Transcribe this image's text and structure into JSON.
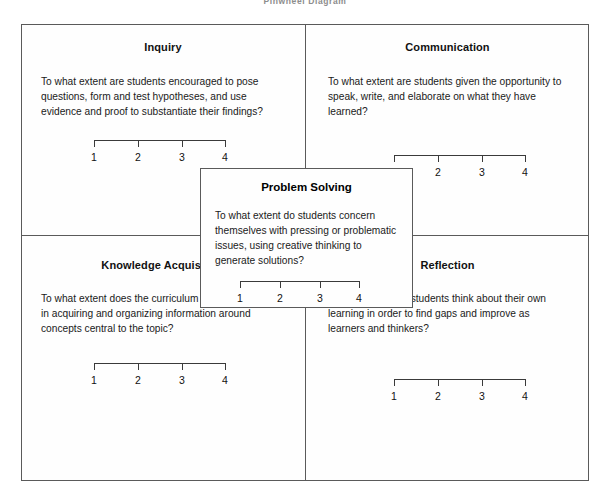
{
  "page": {
    "title_fragment": "Pinwheel Diagram"
  },
  "scale": {
    "labels": [
      "1",
      "2",
      "3",
      "4"
    ]
  },
  "quadrants": [
    {
      "key": "inquiry",
      "heading": "Inquiry",
      "body": "To what extent are students encouraged to pose questions, form and test hypotheses, and use evidence and proof to substantiate their findings?"
    },
    {
      "key": "communication",
      "heading": "Communication",
      "body": "To what extent are students given the opportunity to speak, write, and elaborate on what they have learned?"
    },
    {
      "key": "knowledge",
      "heading": "Knowledge Acquisition",
      "body": "To what extent does the curriculum engage students in acquiring and organizing information around concepts central to the topic?"
    },
    {
      "key": "reflection",
      "heading": "Reflection",
      "body": "To what extent do students think about their own learning in order to find gaps and improve as learners and thinkers?"
    }
  ],
  "center": {
    "heading": "Problem Solving",
    "body": "To what extent do students concern themselves with pressing or problematic issues, using creative thinking to generate solutions?"
  }
}
